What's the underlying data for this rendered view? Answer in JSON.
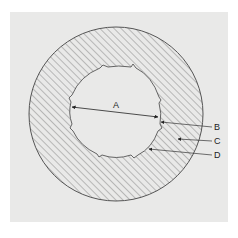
{
  "figure": {
    "colors": {
      "background": "#ffffff",
      "paper": "#e9e9e8",
      "inner_fill": "#e9e9e8",
      "hatch": "#7a7a7a",
      "outline": "#555555",
      "leader": "#333333"
    },
    "labels": {
      "A": "A",
      "B": "B",
      "C": "C",
      "D": "D"
    }
  }
}
